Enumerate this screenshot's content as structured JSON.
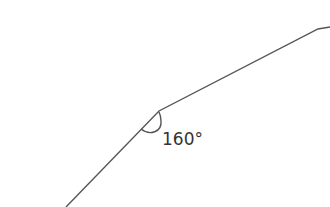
{
  "diagram": {
    "angle_label": "160°",
    "angle_degrees": 160,
    "line_color": "#555555"
  }
}
